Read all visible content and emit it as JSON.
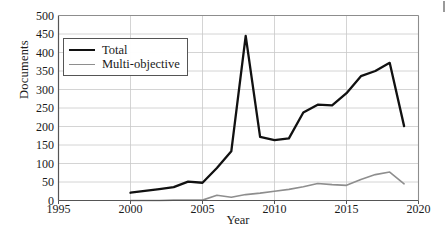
{
  "chart_data": {
    "type": "line",
    "title": "",
    "xlabel": "Year",
    "ylabel": "Documents",
    "xlim": [
      1995,
      2020
    ],
    "ylim": [
      0,
      500
    ],
    "grid": true,
    "grid_axis": "y",
    "legend_position": "upper-left-inside",
    "x_ticks": [
      1995,
      2000,
      2005,
      2010,
      2015,
      2020
    ],
    "y_ticks": [
      0,
      50,
      100,
      150,
      200,
      250,
      300,
      350,
      400,
      450,
      500
    ],
    "x": [
      2000,
      2001,
      2002,
      2003,
      2004,
      2005,
      2006,
      2007,
      2008,
      2009,
      2010,
      2011,
      2012,
      2013,
      2014,
      2015,
      2016,
      2017,
      2018,
      2019
    ],
    "series": [
      {
        "name": "Total",
        "color": "#111111",
        "width": 2.3,
        "values": [
          21,
          26,
          31,
          36,
          51,
          48,
          88,
          133,
          445,
          172,
          163,
          168,
          238,
          259,
          257,
          290,
          336,
          350,
          372,
          201
        ]
      },
      {
        "name": "Multi-objective",
        "color": "#8e8e8e",
        "width": 1.6,
        "x": [
          2000,
          2001,
          2002,
          2003,
          2004,
          2005,
          2006,
          2007,
          2008,
          2009,
          2010,
          2011,
          2012,
          2013,
          2014,
          2015,
          2016,
          2017,
          2018,
          2019
        ],
        "values": [
          0,
          0,
          0,
          1,
          1,
          1,
          14,
          9,
          16,
          20,
          25,
          30,
          37,
          46,
          43,
          41,
          57,
          70,
          77,
          45
        ]
      }
    ],
    "annotations": []
  },
  "legend": {
    "items": [
      {
        "label": "Total"
      },
      {
        "label": "Multi-objective"
      }
    ]
  },
  "axis": {
    "x_label": "Year",
    "y_label": "Documents",
    "x_tick_labels": [
      "1995",
      "2000",
      "2005",
      "2010",
      "2015",
      "2020"
    ],
    "y_tick_labels": [
      "0",
      "50",
      "100",
      "150",
      "200",
      "250",
      "300",
      "350",
      "400",
      "450",
      "500"
    ]
  },
  "colors": {
    "total_line": "#111111",
    "multi_line": "#8e8e8e",
    "grid": "#c9c9c9",
    "axis": "#555555",
    "background": "#ffffff"
  }
}
